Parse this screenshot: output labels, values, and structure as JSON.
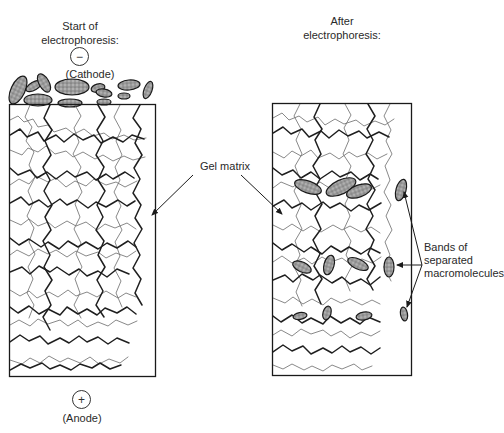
{
  "diagram": {
    "title_left": [
      "Start of",
      "electrophoresis:"
    ],
    "title_right": [
      "After",
      "electrophoresis:"
    ],
    "cathode": {
      "symbol": "−",
      "label": "(Cathode)"
    },
    "anode": {
      "symbol": "+",
      "label": "(Anode)"
    },
    "gel_matrix_label": "Gel matrix",
    "bands_label": [
      "Bands of",
      "separated",
      "macromolecules"
    ],
    "colors": {
      "line": "#1a1a1a",
      "fibers_dark": "#1f1f1f",
      "fibers_light": "#6a6a6a",
      "ellipse_fill": "#8a8a8a",
      "background": "#ffffff"
    }
  }
}
